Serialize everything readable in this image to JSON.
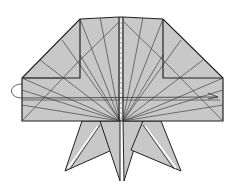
{
  "diagram": {
    "type": "origami-fold-diagram",
    "colors": {
      "paper": "#c8c8c8",
      "edge": "#222222",
      "crease": "#333333",
      "background": "#ffffff",
      "arrow": "#333333"
    },
    "elements": [
      "folded-paper-model",
      "radiating-crease-lines",
      "center-valley-fold-dashed",
      "turn-over-arrow",
      "four-pointed-legs"
    ]
  }
}
